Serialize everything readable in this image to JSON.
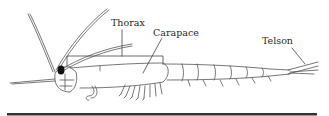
{
  "diagram": {
    "labels": {
      "thorax": "Thorax",
      "carapace": "Carapace",
      "telson": "Telson"
    },
    "colors": {
      "outline": "#4a4a4a",
      "label": "#2a2a2a",
      "eye": "#111111",
      "rule": "#333333"
    }
  }
}
